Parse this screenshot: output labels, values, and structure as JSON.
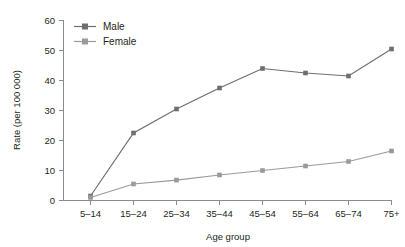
{
  "chart_data": {
    "type": "line",
    "title": "",
    "xlabel": "Age group",
    "ylabel": "Rate (per 100 000)",
    "categories": [
      "5–14",
      "15–24",
      "25–34",
      "35–44",
      "45–54",
      "55–64",
      "65–74",
      "75+"
    ],
    "ylim": [
      0,
      60
    ],
    "yticks": [
      0,
      10,
      20,
      30,
      40,
      50,
      60
    ],
    "grid": false,
    "legend_position": "top-left",
    "series": [
      {
        "name": "Male",
        "color": "#6e6e6e",
        "marker": "square",
        "values": [
          1.5,
          22.5,
          30.5,
          37.5,
          44.0,
          42.5,
          41.5,
          50.5
        ]
      },
      {
        "name": "Female",
        "color": "#9a9a9a",
        "marker": "square",
        "values": [
          1.0,
          5.5,
          6.8,
          8.5,
          10.0,
          11.5,
          13.0,
          16.5
        ]
      }
    ]
  },
  "axis": {
    "tick_labels_y": [
      "0",
      "10",
      "20",
      "30",
      "40",
      "50",
      "60"
    ],
    "tick_labels_x": [
      "5–14",
      "15–24",
      "25–34",
      "35–44",
      "45–54",
      "55–64",
      "65–74",
      "75+"
    ],
    "y_title": "Rate (per 100 000)",
    "x_title": "Age group",
    "axis_color": "#8c8c8c"
  },
  "legend": {
    "entries": [
      {
        "label": "Male",
        "color": "#6e6e6e"
      },
      {
        "label": "Female",
        "color": "#9a9a9a"
      }
    ]
  }
}
